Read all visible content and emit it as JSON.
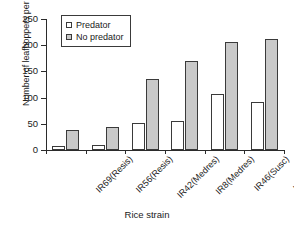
{
  "chart_data": {
    "type": "bar",
    "title": "",
    "xlabel": "Rice strain",
    "ylabel": "Number of leafhoppers per plant",
    "categories": [
      "IR69(Resis)",
      "IR56(Resis)",
      "IR42(Medres)",
      "IR8(Medres)",
      "IR46(Susc)",
      "IR22(Susc)"
    ],
    "series": [
      {
        "name": "Predator",
        "color": "#ffffff",
        "values": [
          7,
          10,
          51,
          56,
          106,
          92
        ]
      },
      {
        "name": "No predator",
        "color": "#c9c9c9",
        "values": [
          39,
          44,
          135,
          170,
          206,
          211
        ]
      }
    ],
    "ylim": [
      0,
      250
    ],
    "yticks": [
      0,
      50,
      100,
      150,
      200,
      250
    ],
    "grid": false,
    "legend_position": "top-left",
    "legend": [
      "Predator",
      "No predator"
    ]
  }
}
